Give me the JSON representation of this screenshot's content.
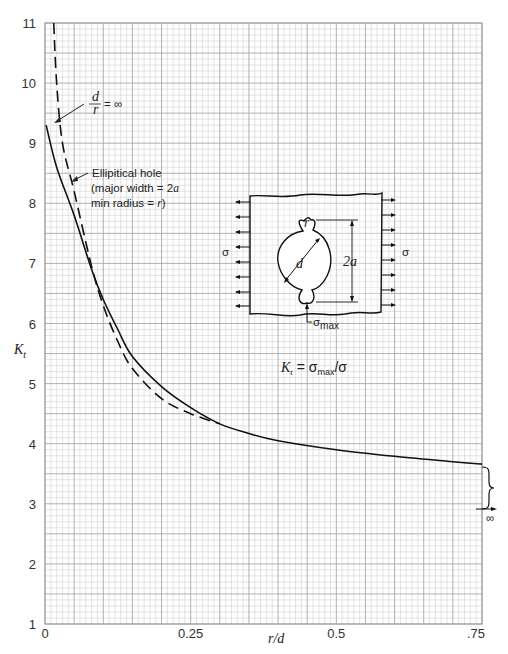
{
  "chart_data": {
    "type": "line",
    "title": "",
    "xlabel": "r/d",
    "ylabel": "K_t",
    "xlim": [
      0,
      0.75
    ],
    "ylim": [
      1,
      11
    ],
    "x_ticks": [
      "0",
      "0.25",
      "0.5",
      ".75"
    ],
    "x_tick_values": [
      0,
      0.25,
      0.5,
      0.75
    ],
    "y_ticks": [
      "1",
      "2",
      "3",
      "4",
      "5",
      "6",
      "7",
      "8",
      "9",
      "10",
      "11"
    ],
    "grid": true,
    "series": [
      {
        "name": "d/r = ∞ (solid)",
        "style": "solid",
        "x": [
          0.002,
          0.02,
          0.05,
          0.08,
          0.1,
          0.125,
          0.15,
          0.2,
          0.25,
          0.3,
          0.35,
          0.4,
          0.5,
          0.6,
          0.7,
          0.75
        ],
        "y": [
          9.3,
          8.6,
          7.8,
          6.9,
          6.4,
          5.9,
          5.45,
          4.95,
          4.6,
          4.33,
          4.17,
          4.05,
          3.9,
          3.79,
          3.7,
          3.66
        ]
      },
      {
        "name": "Elliptical hole (major width = 2a, min radius = r)",
        "style": "dashed",
        "x": [
          0.015,
          0.02,
          0.03,
          0.05,
          0.08,
          0.1,
          0.125,
          0.15,
          0.2,
          0.25,
          0.3
        ],
        "y": [
          11.0,
          10.0,
          9.0,
          8.2,
          6.95,
          6.3,
          5.7,
          5.25,
          4.75,
          4.5,
          4.33
        ]
      }
    ],
    "annotations": {
      "dr_label_num": "d",
      "dr_label_den": "r",
      "dr_label_eq": "= ∞",
      "ellipse_line1": "Ellipitical hole",
      "ellipse_line2": "(major width = 2",
      "ellipse_line2_var": "a",
      "ellipse_line3": "min radius = ",
      "ellipse_line3_var": "r",
      "ellipse_line3_end": ")",
      "formula_k": "K",
      "formula_sub": "t",
      "formula_eq": " = σ",
      "formula_max": "max",
      "formula_end": "/σ",
      "sigma_left": "σ",
      "sigma_right": "σ",
      "diagram_d": "d",
      "diagram_2a": "2a",
      "diagram_r": "r",
      "diagram_sigma": "σ",
      "diagram_sigma_sub": "max",
      "infinity": "∞",
      "y_axis_label_k": "K",
      "y_axis_label_sub": "t",
      "x_axis_label": "r/d"
    }
  }
}
